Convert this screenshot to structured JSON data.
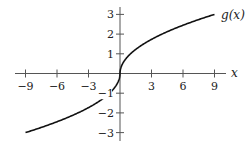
{
  "chart_data": {
    "type": "line",
    "title": "",
    "xlabel": "x",
    "ylabel": "",
    "function_label": "g(x)",
    "function_definition": "g(x) = sign(x)·sqrt(|x|)",
    "xlim": [
      -9,
      9
    ],
    "ylim": [
      -3,
      3
    ],
    "x_ticks": [
      -9,
      -6,
      -3,
      3,
      6,
      9
    ],
    "x_tick_labels": [
      "−9",
      "−6",
      "−3",
      "3",
      "6",
      "9"
    ],
    "y_ticks": [
      -3,
      -2,
      -1,
      1,
      2,
      3
    ],
    "y_tick_labels": [
      "−3",
      "−2",
      "−1",
      "1",
      "2",
      "3"
    ],
    "grid": false,
    "legend": "none",
    "series": [
      {
        "name": "g(x)",
        "x": [
          -9,
          -6,
          -4,
          -3,
          -2,
          -1,
          -0.5,
          -0.1,
          0,
          0.1,
          0.5,
          1,
          2,
          3,
          4,
          6,
          9
        ],
        "values": [
          -3,
          -2.449,
          -2,
          -1.732,
          -1.414,
          -1,
          -0.707,
          -0.316,
          0,
          0.316,
          0.707,
          1,
          1.414,
          1.732,
          2,
          2.449,
          3
        ]
      }
    ],
    "colors": {
      "axis": "#555555",
      "curve": "#111111",
      "text": "#222222"
    }
  }
}
